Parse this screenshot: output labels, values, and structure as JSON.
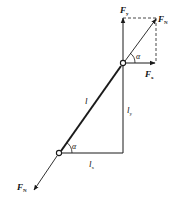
{
  "diagram": {
    "type": "force-decomposition",
    "colors": {
      "line": "#1a1a1a",
      "background": "#ffffff"
    },
    "labels": {
      "fy": {
        "main": "F",
        "sub": "y"
      },
      "fn_top": {
        "main": "F",
        "sub": "N"
      },
      "fx": {
        "main": "F",
        "sub": "x"
      },
      "fn_bottom": {
        "main": "F",
        "sub": "N"
      },
      "alpha_top": "α",
      "alpha_bottom": "α",
      "length": "l",
      "ly": {
        "main": "l",
        "sub": "y"
      },
      "lx": {
        "main": "l",
        "sub": "x"
      }
    }
  }
}
